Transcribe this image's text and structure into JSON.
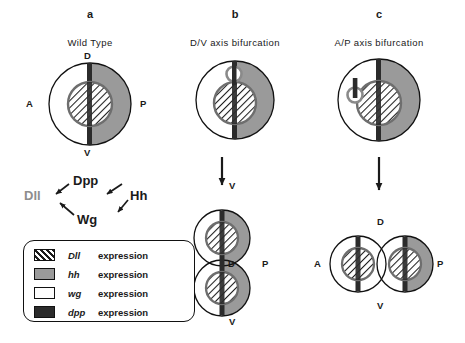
{
  "figure": {
    "background": "#ffffff",
    "colors": {
      "hh_gray": "#9a9a9a",
      "dpp_dark": "#2b2b2b",
      "wg_white": "#ffffff",
      "dll_hatch_line": "#1d1d1d",
      "outline": "#111111",
      "dll_text_gray": "#8d8d8d"
    }
  },
  "panels": [
    {
      "letter": "a",
      "title": "Wild  Type",
      "disc_labels": {
        "top": "D",
        "left": "A",
        "right": "P",
        "bottom": "V"
      }
    },
    {
      "letter": "b",
      "title": "D/V  axis  bifurcation",
      "disc_labels": {
        "top": "D",
        "left": "A",
        "right": "P",
        "bottom": "V"
      },
      "result_labels": {
        "top": "V",
        "left": "A",
        "middle": "D",
        "right": "P",
        "bottom": "V"
      }
    },
    {
      "letter": "c",
      "title": "A/P  axis  bifurcation",
      "disc_labels": {
        "top": "D",
        "left": "A",
        "right": "P",
        "bottom": "V"
      },
      "result_labels": {
        "top": "D",
        "left": "A",
        "right": "P",
        "bottom": "V"
      }
    }
  ],
  "pathway": {
    "nodes": {
      "dpp": "Dpp",
      "hh": "Hh",
      "wg": "Wg",
      "dll": "Dll"
    },
    "edges": [
      {
        "from": "Hh",
        "to": "Dpp"
      },
      {
        "from": "Hh",
        "to": "Wg"
      },
      {
        "from": "Dpp",
        "to": "Dll"
      },
      {
        "from": "Wg",
        "to": "Dll"
      }
    ]
  },
  "legend": {
    "items": [
      {
        "gene": "Dll",
        "label": "expression",
        "swatch": "hatched"
      },
      {
        "gene": "hh",
        "label": "expression",
        "swatch": "gray"
      },
      {
        "gene": "wg",
        "label": "expression",
        "swatch": "white"
      },
      {
        "gene": "dpp",
        "label": "expression",
        "swatch": "dark"
      }
    ]
  }
}
